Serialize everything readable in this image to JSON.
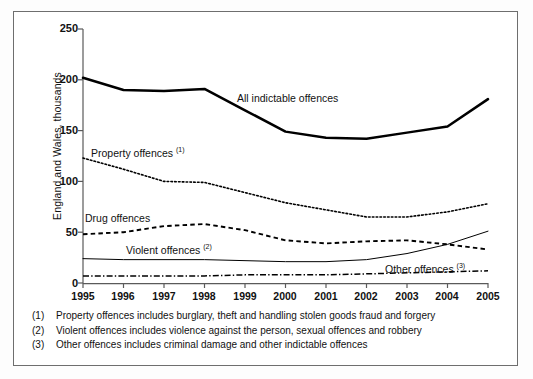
{
  "figure": {
    "ylabel": "England and Wales, thousands",
    "frame_color": "#6e6e6e"
  },
  "notes": [
    {
      "num": "(1)",
      "text": "Property offences includes burglary, theft and handling stolen goods fraud and forgery"
    },
    {
      "num": "(2)",
      "text": "Violent offences includes violence against the person, sexual offences and robbery"
    },
    {
      "num": "(3)",
      "text": "Other offences includes criminal damage and other indictable offences"
    }
  ],
  "series_labels": [
    {
      "text": "All indictable offences",
      "sup": ""
    },
    {
      "text": "Property offences ",
      "sup": "(1)"
    },
    {
      "text": "Drug offences",
      "sup": ""
    },
    {
      "text": "Violent offences ",
      "sup": "(2)"
    },
    {
      "text": "Other offences ",
      "sup": "(3)"
    }
  ],
  "chart_data": {
    "type": "line",
    "title": "",
    "xlabel": "",
    "ylabel": "England and Wales, thousands",
    "x": [
      1995,
      1996,
      1997,
      1998,
      1999,
      2000,
      2001,
      2002,
      2003,
      2004,
      2005
    ],
    "xtick_labels": [
      "1995",
      "1996",
      "1997",
      "1998",
      "1999",
      "2000",
      "2001",
      "2002",
      "2003",
      "2004",
      "2005"
    ],
    "ytick_labels": [
      "0",
      "50",
      "100",
      "150",
      "200",
      "250"
    ],
    "yticks": [
      0,
      50,
      100,
      150,
      200,
      250
    ],
    "ylim": [
      0,
      250
    ],
    "xlim": [
      1995,
      2005
    ],
    "grid": false,
    "legend": "inline-annotations",
    "series": [
      {
        "name": "All indictable offences",
        "style": "solid-thick",
        "color": "#000000",
        "values": [
          202,
          190,
          189,
          191,
          170,
          149,
          143,
          142,
          148,
          154,
          181
        ]
      },
      {
        "name": "Property offences",
        "style": "dotted",
        "color": "#000000",
        "values": [
          123,
          112,
          100,
          99,
          89,
          79,
          72,
          65,
          65,
          70,
          78
        ]
      },
      {
        "name": "Drug offences",
        "style": "dashed",
        "color": "#000000",
        "values": [
          48,
          50,
          56,
          58,
          52,
          42,
          39,
          41,
          42,
          38,
          33
        ]
      },
      {
        "name": "Violent offences",
        "style": "solid-thin",
        "color": "#000000",
        "values": [
          24,
          23,
          23,
          23,
          22,
          21,
          21,
          23,
          29,
          38,
          51
        ]
      },
      {
        "name": "Other offences",
        "style": "dash-dot",
        "color": "#000000",
        "values": [
          7,
          7,
          7,
          7,
          8,
          8,
          8,
          9,
          10,
          11,
          12
        ]
      }
    ]
  }
}
